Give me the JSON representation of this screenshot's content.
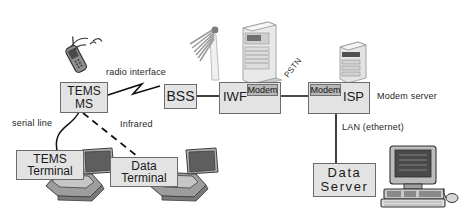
{
  "diagram": {
    "background_color": "#ffffff",
    "box_fill": "#e3e3e3",
    "sub_box_fill": "#b8b8b8",
    "line_color": "#1a1a1a"
  },
  "nodes": {
    "tems_ms": {
      "line1": "TEMS",
      "line2": "MS"
    },
    "bss": {
      "label": "BSS"
    },
    "iwf": {
      "label": "IWF"
    },
    "iwf_modem": {
      "label": "Modem"
    },
    "isp": {
      "label": "ISP"
    },
    "isp_modem": {
      "label": "Modem"
    },
    "tems_terminal": {
      "line1": "TEMS",
      "line2": "Terminal"
    },
    "data_terminal": {
      "line1": "Data",
      "line2": "Terminal"
    },
    "data_server": {
      "line1": "Data",
      "line2": "Server"
    }
  },
  "labels": {
    "radio_interface": "radio interface",
    "pstn": "PSTN",
    "modem_server": "Modem server",
    "lan_ethernet": "LAN (ethernet)",
    "serial_line": "serial line",
    "infrared": "Infrared"
  },
  "icons": {
    "mobile_phone": "mobile-phone-icon",
    "antenna_mast": "antenna-mast-icon",
    "bss_cabinet": "server-cabinet-icon",
    "isp_server": "server-tower-icon",
    "laptop_tems": "laptop-icon",
    "laptop_data": "laptop-icon",
    "desktop_pc": "desktop-computer-icon"
  }
}
